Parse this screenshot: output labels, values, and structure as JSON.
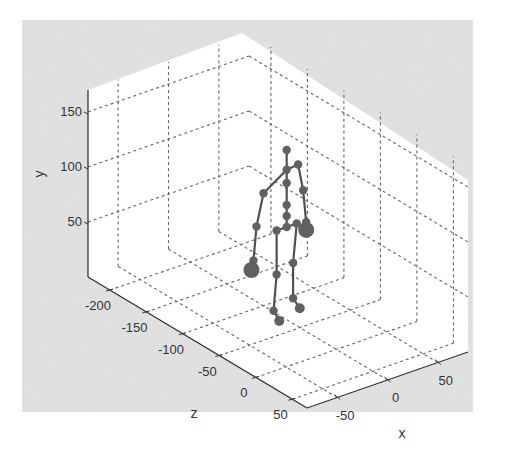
{
  "chart_data": {
    "type": "scatter",
    "subtype": "3d-skeleton",
    "title": "",
    "xlabel": "x",
    "ylabel": "y",
    "zlabel": "z",
    "x_ticks": [
      -50,
      0,
      50
    ],
    "y_ticks": [
      50,
      100,
      150
    ],
    "z_ticks": [
      -200,
      -150,
      -100,
      -50,
      0,
      50
    ],
    "x_tick_labels": [
      "-50",
      "0",
      "50"
    ],
    "y_tick_labels": [
      "50",
      "100",
      "150"
    ],
    "z_tick_labels": [
      "-200",
      "-150",
      "-100",
      "-50",
      "0",
      "50"
    ],
    "xlim": [
      -80,
      80
    ],
    "ylim": [
      0,
      170
    ],
    "zlim": [
      -230,
      70
    ],
    "grid": true,
    "grid_style": "dashed",
    "background_color": "#e6e6e6",
    "axes_color": "#ffffff",
    "marker_color": "#606060",
    "line_color": "#505050",
    "joints": [
      {
        "name": "head",
        "x": 5,
        "y": 150,
        "z": -75
      },
      {
        "name": "neck",
        "x": 5,
        "y": 132,
        "z": -75
      },
      {
        "name": "spine-upper",
        "x": 5,
        "y": 120,
        "z": -75
      },
      {
        "name": "spine-mid",
        "x": 5,
        "y": 100,
        "z": -75
      },
      {
        "name": "spine-lower",
        "x": 5,
        "y": 90,
        "z": -75
      },
      {
        "name": "pelvis",
        "x": 5,
        "y": 80,
        "z": -75
      },
      {
        "name": "shoulder-left",
        "x": -18,
        "y": 118,
        "z": -75
      },
      {
        "name": "elbow-left",
        "x": -25,
        "y": 90,
        "z": -75
      },
      {
        "name": "wrist-left",
        "x": -28,
        "y": 60,
        "z": -75
      },
      {
        "name": "hand-left",
        "x": -30,
        "y": 52,
        "z": -75
      },
      {
        "name": "shoulder-right",
        "x": 20,
        "y": 130,
        "z": -80
      },
      {
        "name": "elbow-right",
        "x": 25,
        "y": 105,
        "z": -80
      },
      {
        "name": "wrist-right",
        "x": 28,
        "y": 75,
        "z": -80
      },
      {
        "name": "hand-right",
        "x": 28,
        "y": 68,
        "z": -80
      },
      {
        "name": "hip-left",
        "x": -5,
        "y": 80,
        "z": -75
      },
      {
        "name": "knee-left",
        "x": -5,
        "y": 40,
        "z": -75
      },
      {
        "name": "ankle-left",
        "x": -8,
        "y": 8,
        "z": -75
      },
      {
        "name": "foot-left",
        "x": -6,
        "y": 0,
        "z": -70
      },
      {
        "name": "hip-right",
        "x": 15,
        "y": 80,
        "z": -75
      },
      {
        "name": "knee-right",
        "x": 15,
        "y": 42,
        "z": -80
      },
      {
        "name": "ankle-right",
        "x": 15,
        "y": 10,
        "z": -80
      },
      {
        "name": "foot-right",
        "x": 18,
        "y": 2,
        "z": -75
      }
    ],
    "bones": [
      [
        "head",
        "neck"
      ],
      [
        "neck",
        "spine-upper"
      ],
      [
        "spine-upper",
        "spine-mid"
      ],
      [
        "spine-mid",
        "spine-lower"
      ],
      [
        "spine-lower",
        "pelvis"
      ],
      [
        "neck",
        "shoulder-left"
      ],
      [
        "shoulder-left",
        "elbow-left"
      ],
      [
        "elbow-left",
        "wrist-left"
      ],
      [
        "wrist-left",
        "hand-left"
      ],
      [
        "neck",
        "shoulder-right"
      ],
      [
        "shoulder-right",
        "elbow-right"
      ],
      [
        "elbow-right",
        "wrist-right"
      ],
      [
        "wrist-right",
        "hand-right"
      ],
      [
        "pelvis",
        "hip-left"
      ],
      [
        "hip-left",
        "knee-left"
      ],
      [
        "knee-left",
        "ankle-left"
      ],
      [
        "ankle-left",
        "foot-left"
      ],
      [
        "pelvis",
        "hip-right"
      ],
      [
        "hip-right",
        "knee-right"
      ],
      [
        "knee-right",
        "ankle-right"
      ],
      [
        "ankle-right",
        "foot-right"
      ]
    ]
  }
}
